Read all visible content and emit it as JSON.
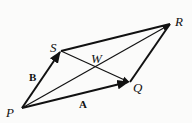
{
  "diagram": {
    "type": "vector-parallelogram",
    "points": {
      "P": {
        "label": "P",
        "x": 22,
        "y": 108
      },
      "Q": {
        "label": "Q",
        "x": 130,
        "y": 82
      },
      "R": {
        "label": "R",
        "x": 170,
        "y": 24
      },
      "S": {
        "label": "S",
        "x": 61,
        "y": 51
      },
      "W": {
        "label": "W"
      }
    },
    "vectors": {
      "A": {
        "label": "A",
        "from": "P",
        "to": "Q"
      },
      "B": {
        "label": "B",
        "from": "P",
        "to": "S"
      }
    },
    "segments": [
      {
        "from": "S",
        "to": "R",
        "style": "thick"
      },
      {
        "from": "Q",
        "to": "R",
        "style": "thick"
      },
      {
        "from": "P",
        "to": "R",
        "style": "thin",
        "arrow": true
      },
      {
        "from": "S",
        "to": "Q",
        "style": "thin",
        "arrow": true
      }
    ],
    "stroke_color": "#111111"
  }
}
